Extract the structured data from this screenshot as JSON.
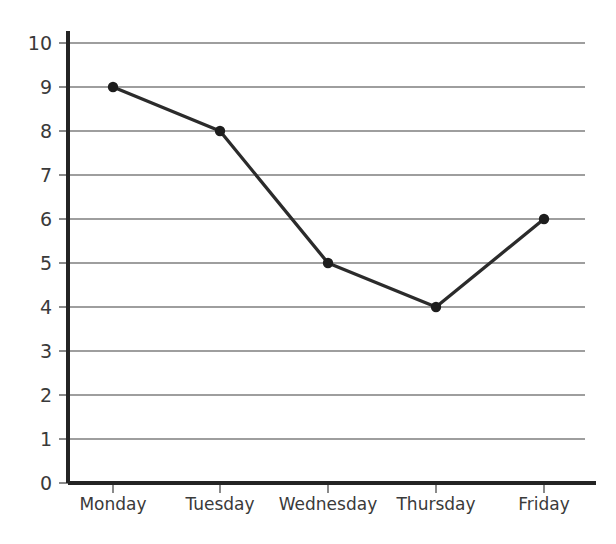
{
  "chart_data": {
    "type": "line",
    "title": "",
    "subtitle": "",
    "xlabel": "",
    "ylabel": "",
    "categories": [
      "Monday",
      "Tuesday",
      "Wednesday",
      "Thursday",
      "Friday"
    ],
    "values": [
      9,
      8,
      5,
      4,
      6
    ],
    "series": [
      {
        "name": "",
        "values": [
          9,
          8,
          5,
          4,
          6
        ]
      }
    ],
    "ylim": [
      0,
      10
    ],
    "ytick_labels": [
      "0",
      "1",
      "2",
      "3",
      "4",
      "5",
      "6",
      "7",
      "8",
      "9",
      "10"
    ],
    "ytick_values": [
      0,
      1,
      2,
      3,
      4,
      5,
      6,
      7,
      8,
      9,
      10
    ],
    "ytick_step": 1,
    "grid": {
      "horizontal": true,
      "vertical": false
    },
    "legend": {
      "visible": false,
      "position": "none",
      "entries": []
    },
    "annotations": [],
    "markers": {
      "shape": "circle",
      "visible": true
    },
    "colors": {
      "line": "#2b2b2b",
      "marker": "#1d1d1d",
      "gridline": "#9e9e9e",
      "axis": "#242424",
      "tick_mark": "#8a8a8a",
      "text": "#3a3a3a",
      "background": "#ffffff"
    }
  },
  "plot_geometry": {
    "left": 68,
    "right": 585,
    "top": 43,
    "bottom": 483,
    "category_x": [
      113,
      220,
      328,
      436,
      544
    ],
    "xlabel_y": 497
  }
}
